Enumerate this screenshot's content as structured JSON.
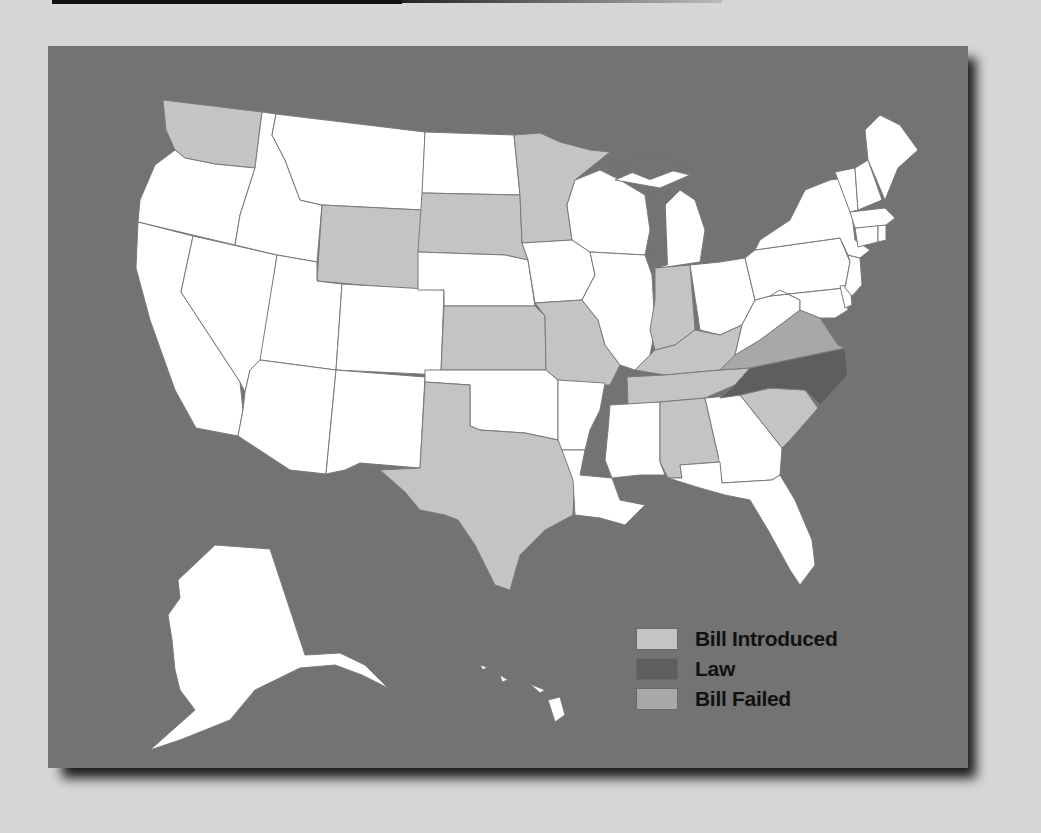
{
  "figure": {
    "title": "",
    "background_color": "#737373",
    "ocean_color": "#737373"
  },
  "legend": {
    "items": [
      {
        "label": "Bill Introduced",
        "color": "#c4c4c4"
      },
      {
        "label": "Law",
        "color": "#5e5e5e"
      },
      {
        "label": "Bill Failed",
        "color": "#a8a8a8"
      }
    ]
  },
  "categories": {
    "bill_introduced": [
      "Washington",
      "Wyoming",
      "South Dakota",
      "Minnesota",
      "Kansas",
      "Missouri",
      "Indiana",
      "Kentucky",
      "Tennessee",
      "Alabama",
      "South Carolina",
      "Texas"
    ],
    "law": [
      "North Carolina"
    ],
    "bill_failed": [
      "Virginia"
    ],
    "none": [
      "Oregon",
      "California",
      "Nevada",
      "Idaho",
      "Montana",
      "Utah",
      "Arizona",
      "Colorado",
      "New Mexico",
      "North Dakota",
      "Nebraska",
      "Oklahoma",
      "Iowa",
      "Arkansas",
      "Louisiana",
      "Wisconsin",
      "Illinois",
      "Michigan",
      "Mississippi",
      "Ohio",
      "West Virginia",
      "Georgia",
      "Florida",
      "Pennsylvania",
      "New York",
      "Vermont",
      "New Hampshire",
      "Maine",
      "Massachusetts",
      "Connecticut",
      "Rhode Island",
      "New Jersey",
      "Delaware",
      "Maryland",
      "Alaska",
      "Hawaii"
    ]
  }
}
